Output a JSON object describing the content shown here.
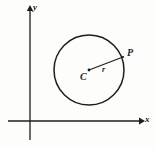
{
  "figure": {
    "type": "geometry-diagram",
    "background_color": "#fdfdfc",
    "ink_color": "#1d1d1d",
    "axes": {
      "x_axis": {
        "label": "x",
        "label_style": "italic",
        "arrow": "right",
        "start_px": [
          8,
          121
        ],
        "end_px": [
          143,
          121
        ]
      },
      "y_axis": {
        "label": "y",
        "label_style": "italic",
        "arrow": "up",
        "start_px": [
          30,
          140
        ],
        "end_px": [
          30,
          7
        ]
      },
      "origin_px": [
        30,
        121
      ]
    },
    "circle": {
      "center_px": [
        89,
        70
      ],
      "radius_px": 35,
      "stroke_width": 1.4
    },
    "center_point": {
      "label": "C",
      "label_style": "italic",
      "dot_px": [
        89,
        70
      ],
      "dot_radius_px": 1.3
    },
    "radius_segment": {
      "label": "r",
      "label_style": "italic",
      "from_px": [
        89,
        70
      ],
      "to_px": [
        123,
        57
      ]
    },
    "point_on_circle": {
      "label": "P",
      "label_style": "italic",
      "position_px": [
        123,
        57
      ]
    }
  }
}
